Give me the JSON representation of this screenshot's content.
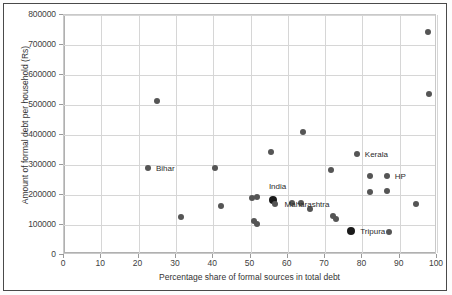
{
  "chart_data": {
    "type": "scatter",
    "title": "",
    "xlabel": "Percentage share of formal sources in total debt",
    "ylabel": "Amount of formal debt per household (Rs)",
    "xlim": [
      0,
      100
    ],
    "ylim": [
      0,
      800000
    ],
    "xticks": [
      0,
      10,
      20,
      30,
      40,
      50,
      60,
      70,
      80,
      90,
      100
    ],
    "yticks": [
      0,
      100000,
      200000,
      300000,
      400000,
      500000,
      600000,
      700000,
      800000
    ],
    "xtick_labels": [
      "0",
      "10",
      "20",
      "30",
      "40",
      "50",
      "60",
      "70",
      "80",
      "90",
      "100"
    ],
    "ytick_labels": [
      "0",
      "100000",
      "200000",
      "300000",
      "400000",
      "500000",
      "600000",
      "700000",
      "800000"
    ],
    "grid": true,
    "legend": false,
    "marker_color": "#555555",
    "highlight_color": "#1a1a1a",
    "points": [
      {
        "x": 22.5,
        "y": 290000,
        "label": "Bihar",
        "label_dx": 8,
        "highlight": false
      },
      {
        "x": 25.0,
        "y": 512000,
        "label": "",
        "label_dx": 0,
        "highlight": false
      },
      {
        "x": 31.5,
        "y": 128000,
        "label": "",
        "label_dx": 0,
        "highlight": false
      },
      {
        "x": 40.5,
        "y": 291000,
        "label": "",
        "label_dx": 0,
        "highlight": false
      },
      {
        "x": 42.0,
        "y": 162000,
        "label": "",
        "label_dx": 0,
        "highlight": false
      },
      {
        "x": 50.5,
        "y": 190000,
        "label": "",
        "label_dx": 0,
        "highlight": false
      },
      {
        "x": 51.8,
        "y": 192000,
        "label": "",
        "label_dx": 0,
        "highlight": false
      },
      {
        "x": 51.0,
        "y": 113000,
        "label": "",
        "label_dx": 0,
        "highlight": false
      },
      {
        "x": 51.8,
        "y": 103000,
        "label": "",
        "label_dx": 0,
        "highlight": false
      },
      {
        "x": 55.5,
        "y": 344000,
        "label": "",
        "label_dx": 0,
        "highlight": false
      },
      {
        "x": 56.0,
        "y": 182000,
        "label": "India",
        "label_dx": -4,
        "label_dy": -14,
        "highlight": true
      },
      {
        "x": 56.5,
        "y": 170000,
        "label": "",
        "label_dx": 0,
        "highlight": false
      },
      {
        "x": 61.0,
        "y": 172000,
        "label": "",
        "label_dx": 0,
        "highlight": false
      },
      {
        "x": 63.5,
        "y": 172000,
        "label": "",
        "label_dx": 0,
        "highlight": false
      },
      {
        "x": 64.0,
        "y": 410000,
        "label": "",
        "label_dx": 0,
        "highlight": false
      },
      {
        "x": 66.0,
        "y": 152000,
        "label": "",
        "label_dx": 0,
        "highlight": false
      },
      {
        "x": 71.5,
        "y": 282000,
        "label": "",
        "label_dx": 0,
        "highlight": false
      },
      {
        "x": 72.0,
        "y": 130000,
        "label": "Maharashtra",
        "label_dx": -48,
        "label_dy": -12,
        "highlight": false
      },
      {
        "x": 72.8,
        "y": 121000,
        "label": "",
        "label_dx": 0,
        "highlight": false
      },
      {
        "x": 77.0,
        "y": 80000,
        "label": "Tripura",
        "label_dx": 9,
        "highlight": true
      },
      {
        "x": 78.5,
        "y": 338000,
        "label": "Kerala",
        "label_dx": 8,
        "highlight": false
      },
      {
        "x": 82.0,
        "y": 262000,
        "label": "",
        "label_dx": 0,
        "highlight": false
      },
      {
        "x": 82.0,
        "y": 210000,
        "label": "",
        "label_dx": 0,
        "highlight": false
      },
      {
        "x": 86.5,
        "y": 262000,
        "label": "HP",
        "label_dx": 8,
        "highlight": false
      },
      {
        "x": 86.5,
        "y": 212000,
        "label": "",
        "label_dx": 0,
        "highlight": false
      },
      {
        "x": 87.0,
        "y": 78000,
        "label": "",
        "label_dx": 0,
        "highlight": false
      },
      {
        "x": 94.5,
        "y": 170000,
        "label": "",
        "label_dx": 0,
        "highlight": false
      },
      {
        "x": 97.5,
        "y": 745000,
        "label": "",
        "label_dx": 0,
        "highlight": false
      },
      {
        "x": 97.8,
        "y": 538000,
        "label": "",
        "label_dx": 0,
        "highlight": false
      }
    ]
  }
}
